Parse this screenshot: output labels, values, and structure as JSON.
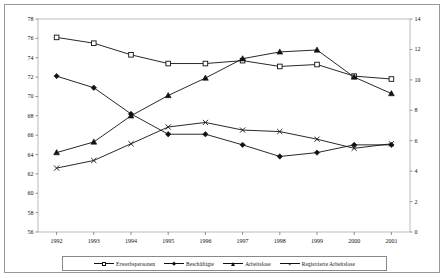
{
  "chart_data": {
    "type": "line",
    "title": "",
    "xlabel": "",
    "ylabel": "",
    "categories": [
      "1992",
      "1993",
      "1994",
      "1995",
      "1996",
      "1997",
      "1998",
      "1999",
      "2000",
      "2001"
    ],
    "left_axis": {
      "min": 56,
      "max": 78,
      "step": 2,
      "ticks": [
        "56",
        "58",
        "60",
        "62",
        "64",
        "66",
        "68",
        "70",
        "72",
        "74",
        "76",
        "78"
      ]
    },
    "right_axis": {
      "min": 0,
      "max": 14,
      "step": 2,
      "ticks": [
        "0",
        "2",
        "4",
        "6",
        "8",
        "10",
        "12",
        "14"
      ]
    },
    "grid": false,
    "legend_position": "bottom",
    "series": [
      {
        "name": "Erwerbspersonen",
        "marker": "open-square",
        "axis": "left",
        "values": [
          76.1,
          75.5,
          74.3,
          73.4,
          73.4,
          73.7,
          73.1,
          73.3,
          72.1,
          71.8
        ]
      },
      {
        "name": "Beschäftigte",
        "marker": "filled-diamond",
        "axis": "left",
        "values": [
          72.1,
          70.9,
          68.2,
          66.1,
          66.1,
          65.0,
          63.8,
          64.2,
          65.0,
          65.0
        ]
      },
      {
        "name": "Arbeitslose",
        "marker": "filled-triangle",
        "axis": "left",
        "values": [
          64.2,
          65.3,
          68.0,
          70.1,
          71.9,
          73.9,
          74.6,
          74.8,
          72.0,
          70.3
        ]
      },
      {
        "name": "Registrierte Arbeitslose",
        "marker": "x-cross",
        "axis": "right",
        "values": [
          4.2,
          4.7,
          5.8,
          6.9,
          7.2,
          6.7,
          6.6,
          6.1,
          5.5,
          5.8
        ]
      }
    ]
  },
  "legend": {
    "items": [
      {
        "label": "Erwerbspersonen"
      },
      {
        "label": "Beschäftigte"
      },
      {
        "label": "Arbeitslose"
      },
      {
        "label": "Registrierte Arbeitslose"
      }
    ]
  }
}
